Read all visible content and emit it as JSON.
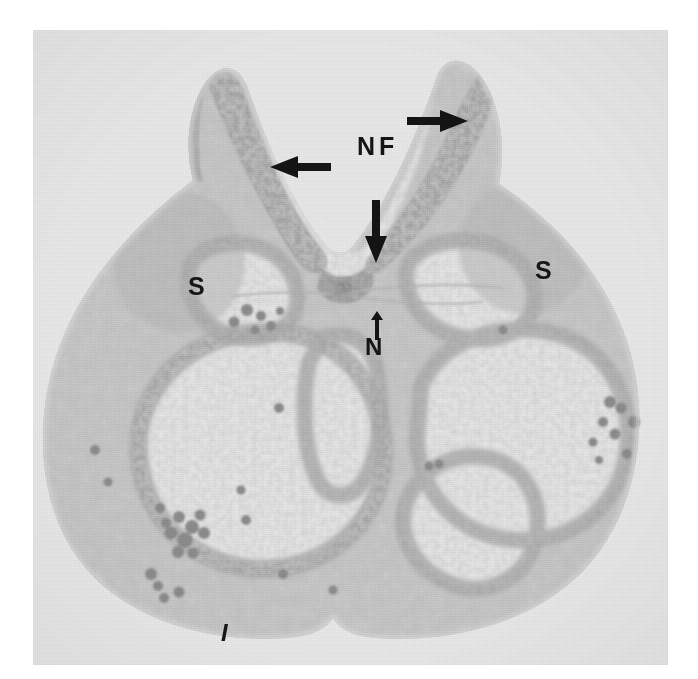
{
  "figure": {
    "type": "light-micrograph",
    "plate": {
      "background_color": "#ffffff",
      "film_color": "#e9e9e9",
      "tissue_color": "#b9b9b9",
      "lumen_color": "#e4e4e4",
      "ink_color": "#151515",
      "left": 33,
      "top": 30,
      "width": 635,
      "height": 635
    },
    "annotations": [
      {
        "id": "label-nf",
        "text": "NF",
        "name": "neural-fold-label",
        "x": 324,
        "y": 104,
        "style": "label-nf"
      },
      {
        "id": "label-s-left",
        "text": "S",
        "name": "somite-label-left",
        "x": 155,
        "y": 244,
        "style": "label-s"
      },
      {
        "id": "label-s-right",
        "text": "S",
        "name": "somite-label-right",
        "x": 502,
        "y": 228,
        "style": "label-s"
      },
      {
        "id": "label-n",
        "text": "N",
        "name": "notochord-label",
        "x": 332,
        "y": 305,
        "style": "label-n"
      },
      {
        "id": "label-i",
        "text": "I",
        "name": "intestine-label",
        "x": 188,
        "y": 591,
        "style": "label-i"
      }
    ],
    "arrows": [
      {
        "id": "arrow-right",
        "name": "arrow-right-neural-fold",
        "direction": "right",
        "x": 374,
        "y": 78,
        "length": 60,
        "thickness": 24
      },
      {
        "id": "arrow-left",
        "name": "arrow-left-neural-fold",
        "direction": "left",
        "x": 236,
        "y": 124,
        "length": 60,
        "thickness": 24
      },
      {
        "id": "arrow-down",
        "name": "arrow-down-neural-groove",
        "direction": "down",
        "x": 330,
        "y": 170,
        "length": 62,
        "thickness": 24
      },
      {
        "id": "arrow-up",
        "name": "arrow-up-notochord",
        "direction": "up",
        "x": 336,
        "y": 281,
        "length": 27,
        "thickness": 14
      }
    ]
  }
}
